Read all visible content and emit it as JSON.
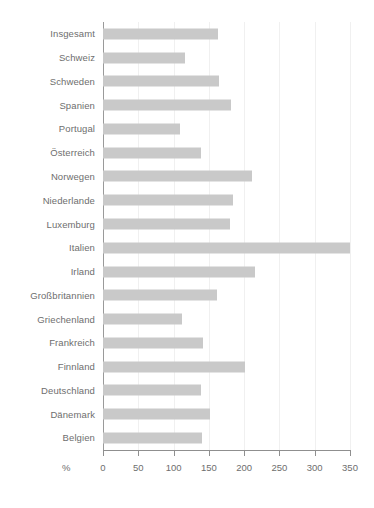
{
  "chart_data": {
    "type": "bar",
    "orientation": "horizontal",
    "title": "",
    "subtitle": "",
    "xlabel": "%",
    "ylabel": "",
    "xlim": [
      0,
      350
    ],
    "xticks": [
      0,
      50,
      100,
      150,
      200,
      250,
      300,
      350
    ],
    "xticklabels": [
      "0",
      "50",
      "100",
      "150",
      "200",
      "250",
      "300",
      "350"
    ],
    "grid": true,
    "grid_axis": "x",
    "legend": false,
    "legend_position": "none",
    "bar_color": "#c9c9c9",
    "axis_color": "#8f8f8f",
    "grid_color": "#f0f0f0",
    "label_color": "#6e6e6e",
    "categories": [
      "Insgesamt",
      "Schweiz",
      "Schweden",
      "Spanien",
      "Portugal",
      "Österreich",
      "Norwegen",
      "Niederlande",
      "Luxemburg",
      "Italien",
      "Irland",
      "Großbritannien",
      "Griechenland",
      "Frankreich",
      "Finnland",
      "Deutschland",
      "Dänemark",
      "Belgien"
    ],
    "values": [
      163,
      116,
      164,
      181,
      109,
      139,
      211,
      184,
      180,
      350,
      215,
      161,
      112,
      142,
      201,
      139,
      152,
      140
    ]
  }
}
